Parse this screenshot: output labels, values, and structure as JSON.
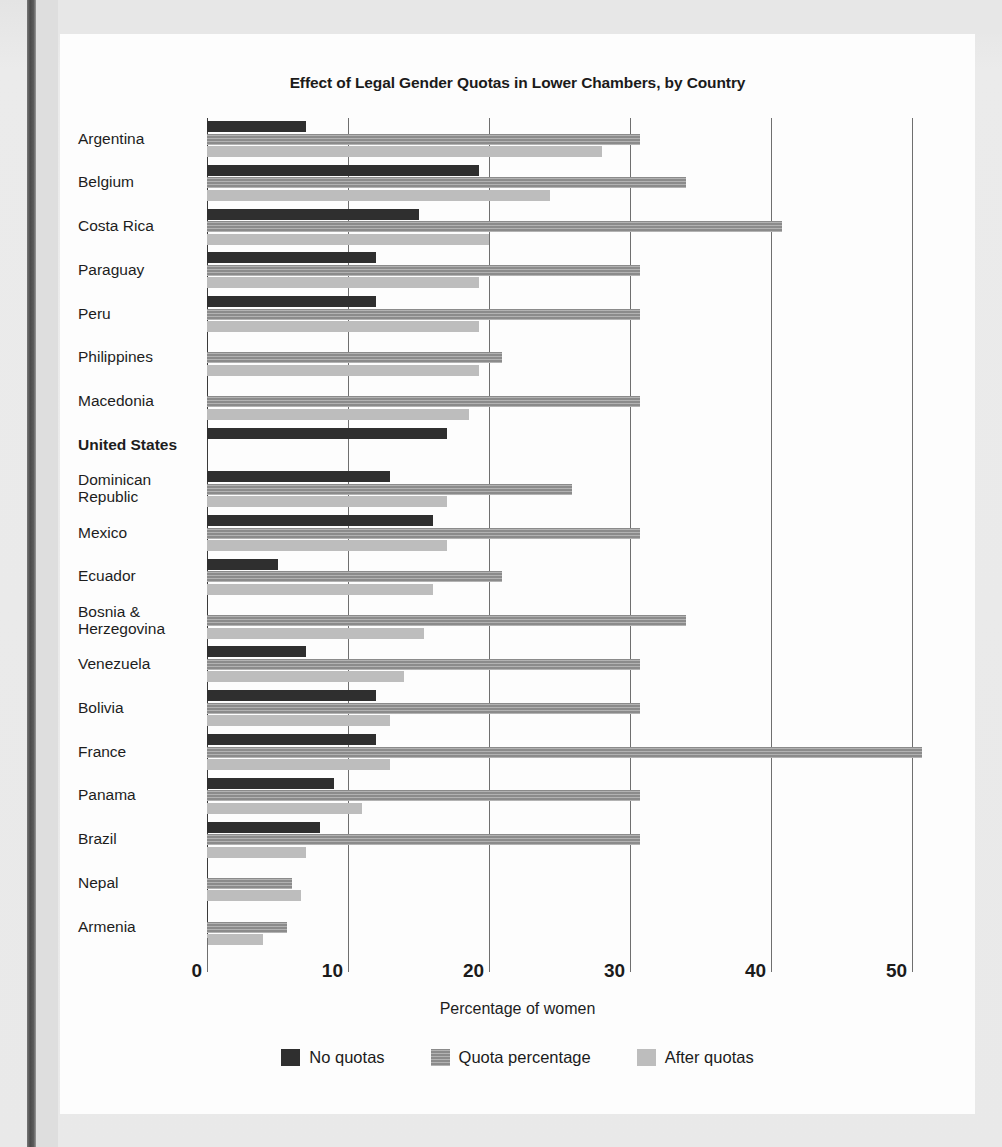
{
  "chart_data": {
    "type": "bar",
    "orientation": "horizontal",
    "title": "Effect of Legal Gender Quotas in Lower Chambers, by Country",
    "xlabel": "Percentage of women",
    "ylabel": "",
    "xlim": [
      0,
      54.25
    ],
    "xticks": [
      0,
      10,
      20,
      30,
      40,
      50
    ],
    "xticklabels": [
      "0",
      "10",
      "20",
      "30",
      "40",
      "50"
    ],
    "grid": "vertical",
    "legend_position": "bottom",
    "highlight_category": "United States",
    "colors": {
      "no_quotas": "#2f2f2f",
      "quota_percentage": "#8b8b8b",
      "after_quotas": "#bdbdbd",
      "gridline": "#6f6f6f",
      "card_background": "#fdfdfd",
      "page_background": "#e8e8e8"
    },
    "series": [
      {
        "name": "No quotas",
        "key": "no_quotas",
        "swatch": "#2f2f2f"
      },
      {
        "name": "Quota percentage",
        "key": "quota_percentage",
        "swatch": "#8b8b8b"
      },
      {
        "name": "After quotas",
        "key": "after_quotas",
        "swatch": "#bdbdbd"
      }
    ],
    "categories": [
      "Argentina",
      "Belgium",
      "Costa Rica",
      "Paraguay",
      "Peru",
      "Philippines",
      "Macedonia",
      "United States",
      "Dominican\nRepublic",
      "Mexico",
      "Ecuador",
      "Bosnia &\nHerzegovina",
      "Venezuela",
      "Bolivia",
      "France",
      "Panama",
      "Brazil",
      "Nepal",
      "Armenia"
    ],
    "rows": [
      {
        "country": "Argentina",
        "bold": false,
        "no_quotas": 7.0,
        "quota_percentage": 30.7,
        "after_quotas": 28.0
      },
      {
        "country": "Belgium",
        "bold": false,
        "no_quotas": 19.3,
        "quota_percentage": 34.0,
        "after_quotas": 24.3
      },
      {
        "country": "Costa Rica",
        "bold": false,
        "no_quotas": 15.0,
        "quota_percentage": 40.8,
        "after_quotas": 20.0
      },
      {
        "country": "Paraguay",
        "bold": false,
        "no_quotas": 12.0,
        "quota_percentage": 30.7,
        "after_quotas": 19.3
      },
      {
        "country": "Peru",
        "bold": false,
        "no_quotas": 12.0,
        "quota_percentage": 30.7,
        "after_quotas": 19.3
      },
      {
        "country": "Philippines",
        "bold": false,
        "no_quotas": 0,
        "quota_percentage": 20.9,
        "after_quotas": 19.3
      },
      {
        "country": "Macedonia",
        "bold": false,
        "no_quotas": 0,
        "quota_percentage": 30.7,
        "after_quotas": 18.6
      },
      {
        "country": "United States",
        "bold": true,
        "no_quotas": 17.0,
        "quota_percentage": 0,
        "after_quotas": 0
      },
      {
        "country": "Dominican\nRepublic",
        "bold": false,
        "no_quotas": 13.0,
        "quota_percentage": 25.9,
        "after_quotas": 17.0
      },
      {
        "country": "Mexico",
        "bold": false,
        "no_quotas": 16.0,
        "quota_percentage": 30.7,
        "after_quotas": 17.0
      },
      {
        "country": "Ecuador",
        "bold": false,
        "no_quotas": 5.0,
        "quota_percentage": 20.9,
        "after_quotas": 16.0
      },
      {
        "country": "Bosnia &\nHerzegovina",
        "bold": false,
        "no_quotas": 0,
        "quota_percentage": 34.0,
        "after_quotas": 15.4
      },
      {
        "country": "Venezuela",
        "bold": false,
        "no_quotas": 7.0,
        "quota_percentage": 30.7,
        "after_quotas": 14.0
      },
      {
        "country": "Bolivia",
        "bold": false,
        "no_quotas": 12.0,
        "quota_percentage": 30.7,
        "after_quotas": 13.0
      },
      {
        "country": "France",
        "bold": false,
        "no_quotas": 12.0,
        "quota_percentage": 50.7,
        "after_quotas": 13.0
      },
      {
        "country": "Panama",
        "bold": false,
        "no_quotas": 9.0,
        "quota_percentage": 30.7,
        "after_quotas": 11.0
      },
      {
        "country": "Brazil",
        "bold": false,
        "no_quotas": 8.0,
        "quota_percentage": 30.7,
        "after_quotas": 7.0
      },
      {
        "country": "Nepal",
        "bold": false,
        "no_quotas": 0,
        "quota_percentage": 6.0,
        "after_quotas": 6.7
      },
      {
        "country": "Armenia",
        "bold": false,
        "no_quotas": 0,
        "quota_percentage": 5.7,
        "after_quotas": 4.0
      }
    ]
  }
}
